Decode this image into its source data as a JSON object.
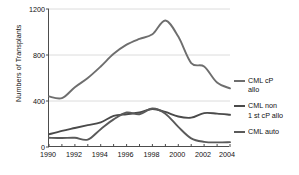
{
  "chart_data": {
    "type": "line",
    "title": "",
    "xlabel": "",
    "ylabel": "Numbers of Transplants",
    "xlim": [
      1990,
      2004
    ],
    "ylim": [
      0,
      1200
    ],
    "yticks": [
      0,
      400,
      800,
      1200
    ],
    "xticks": [
      1990,
      1992,
      1994,
      1996,
      1998,
      2000,
      2002,
      2004
    ],
    "grid": true,
    "legend_position": "right",
    "x": [
      1990,
      1991,
      1992,
      1993,
      1994,
      1995,
      1996,
      1997,
      1998,
      1999,
      2000,
      2001,
      2002,
      2003,
      2004
    ],
    "series": [
      {
        "name": "CML cP allo",
        "color": "#6e6e6e",
        "values": [
          440,
          425,
          520,
          600,
          700,
          810,
          890,
          940,
          980,
          1100,
          960,
          730,
          700,
          560,
          510
        ]
      },
      {
        "name": "CML non 1 st cP allo",
        "color": "#4a4a4a",
        "values": [
          110,
          140,
          165,
          190,
          215,
          270,
          285,
          300,
          330,
          305,
          265,
          255,
          295,
          290,
          280
        ]
      },
      {
        "name": "CML auto",
        "color": "#5a5a5a",
        "values": [
          80,
          78,
          80,
          65,
          155,
          240,
          300,
          285,
          335,
          290,
          175,
          75,
          45,
          40,
          42
        ]
      }
    ]
  },
  "axis": {
    "ylabel": "Numbers of Transplants",
    "yticks": [
      "1200",
      "800",
      "400",
      "0"
    ],
    "xticks": [
      "1990",
      "1992",
      "1994",
      "1996",
      "1998",
      "2000",
      "2002",
      "2004"
    ]
  },
  "legend": {
    "items": [
      {
        "label": "CML cP\nallo"
      },
      {
        "label": "CML non\n1 st cP allo"
      },
      {
        "label": "CML auto"
      }
    ]
  }
}
